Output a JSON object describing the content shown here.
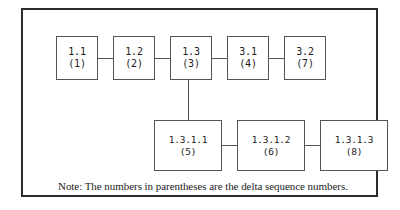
{
  "diagram": {
    "frame_color": "#2b2b2b",
    "node_border_color": "#555555",
    "background": "#ffffff",
    "top_row": [
      {
        "code": "1.1",
        "seq": "(1)"
      },
      {
        "code": "1.2",
        "seq": "(2)"
      },
      {
        "code": "1.3",
        "seq": "(3)"
      },
      {
        "code": "3.1",
        "seq": "(4)"
      },
      {
        "code": "3.2",
        "seq": "(7)"
      }
    ],
    "bottom_row": [
      {
        "code": "1.3.1.1",
        "seq": "(5)"
      },
      {
        "code": "1.3.1.2",
        "seq": "(6)"
      },
      {
        "code": "1.3.1.3",
        "seq": "(8)"
      }
    ],
    "note": "Note: The numbers in parentheses are the delta sequence numbers."
  },
  "chart_data": {
    "type": "diagram",
    "nodes": [
      {
        "id": "1.1",
        "label": "1.1",
        "delta_sequence": 1,
        "row": "top",
        "index": 0
      },
      {
        "id": "1.2",
        "label": "1.2",
        "delta_sequence": 2,
        "row": "top",
        "index": 1
      },
      {
        "id": "1.3",
        "label": "1.3",
        "delta_sequence": 3,
        "row": "top",
        "index": 2
      },
      {
        "id": "3.1",
        "label": "3.1",
        "delta_sequence": 4,
        "row": "top",
        "index": 3
      },
      {
        "id": "3.2",
        "label": "3.2",
        "delta_sequence": 7,
        "row": "top",
        "index": 4
      },
      {
        "id": "1.3.1.1",
        "label": "1.3.1.1",
        "delta_sequence": 5,
        "row": "bottom",
        "index": 0
      },
      {
        "id": "1.3.1.2",
        "label": "1.3.1.2",
        "delta_sequence": 6,
        "row": "bottom",
        "index": 1
      },
      {
        "id": "1.3.1.3",
        "label": "1.3.1.3",
        "delta_sequence": 8,
        "row": "bottom",
        "index": 2
      }
    ],
    "edges": [
      {
        "from": "1.1",
        "to": "1.2",
        "orientation": "horizontal"
      },
      {
        "from": "1.2",
        "to": "1.3",
        "orientation": "horizontal"
      },
      {
        "from": "1.3",
        "to": "3.1",
        "orientation": "horizontal"
      },
      {
        "from": "3.1",
        "to": "3.2",
        "orientation": "horizontal"
      },
      {
        "from": "1.3",
        "to": "1.3.1.1",
        "orientation": "vertical"
      },
      {
        "from": "1.3.1.1",
        "to": "1.3.1.2",
        "orientation": "horizontal"
      },
      {
        "from": "1.3.1.2",
        "to": "1.3.1.3",
        "orientation": "horizontal"
      }
    ],
    "annotations": [
      "Note: The numbers in parentheses are the delta sequence numbers."
    ]
  }
}
